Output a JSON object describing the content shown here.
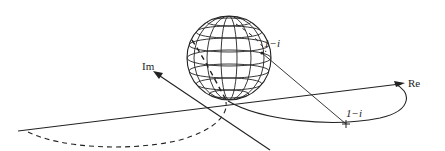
{
  "diagram": {
    "type": "riemann-sphere-stereographic-projection",
    "labels": {
      "re_axis": "Re",
      "im_axis": "Im",
      "point_on_sphere": "1−i",
      "point_on_plane": "1−i"
    },
    "colors": {
      "ink": "#222222",
      "background": "#ffffff"
    }
  }
}
